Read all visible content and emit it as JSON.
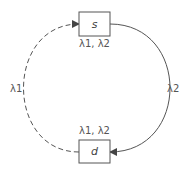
{
  "nodes": {
    "s": {
      "label": "s",
      "annotation": "λ1, λ2"
    },
    "d": {
      "label": "d",
      "annotation": "λ1, λ2"
    }
  },
  "edges": {
    "left": {
      "label": "λ1",
      "style": "dashed",
      "from": "d",
      "to": "s"
    },
    "right": {
      "label": "λ2",
      "style": "solid",
      "from": "s",
      "to": "d"
    }
  },
  "colors": {
    "stroke": "#555555",
    "text": "#555555"
  }
}
